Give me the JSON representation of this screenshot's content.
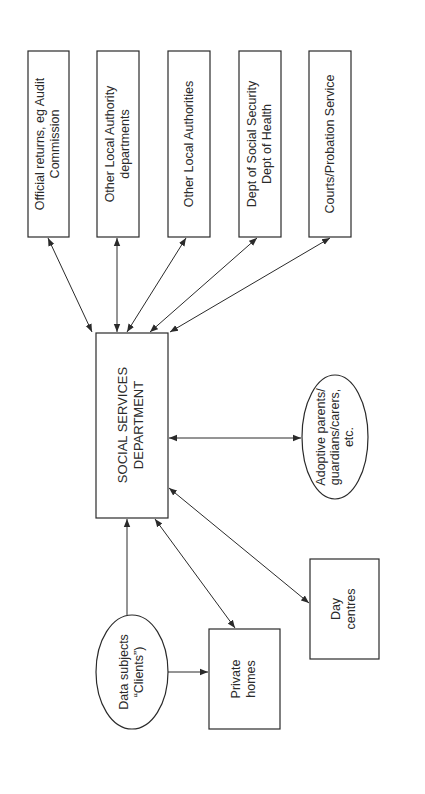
{
  "diagram": {
    "center": {
      "id": "ssd",
      "lines": [
        "SOCIAL SERVICES",
        "DEPARTMENT"
      ],
      "shape": "rectangle"
    },
    "top_boxes": [
      {
        "id": "audit",
        "lines": [
          "Official returns, eg Audit",
          "Commission"
        ]
      },
      {
        "id": "other-dept",
        "lines": [
          "Other Local Authority",
          "departments"
        ]
      },
      {
        "id": "other-la",
        "lines": [
          "Other Local Authorities"
        ]
      },
      {
        "id": "dss",
        "lines": [
          "Dept of Social Security",
          "Dept of Health"
        ]
      },
      {
        "id": "courts",
        "lines": [
          "Courts/Probation Service"
        ]
      }
    ],
    "adoptive": {
      "lines": [
        "Adoptive parents/",
        "guardians/carers,",
        "etc."
      ],
      "shape": "ellipse"
    },
    "clients": {
      "lines": [
        "Data subjects",
        "“Clients”)"
      ],
      "shape": "ellipse"
    },
    "private_homes": {
      "lines": [
        "Private",
        "homes"
      ],
      "shape": "rectangle"
    },
    "day_centres": {
      "lines": [
        "Day",
        "centres"
      ],
      "shape": "rectangle"
    },
    "edges": [
      {
        "from": "ssd",
        "to": "audit",
        "direction": "both"
      },
      {
        "from": "ssd",
        "to": "other-dept",
        "direction": "both"
      },
      {
        "from": "ssd",
        "to": "other-la",
        "direction": "both"
      },
      {
        "from": "ssd",
        "to": "dss",
        "direction": "both"
      },
      {
        "from": "ssd",
        "to": "courts",
        "direction": "both"
      },
      {
        "from": "ssd",
        "to": "adoptive",
        "direction": "both"
      },
      {
        "from": "clients",
        "to": "ssd",
        "direction": "forward"
      },
      {
        "from": "ssd",
        "to": "private_homes",
        "direction": "both"
      },
      {
        "from": "ssd",
        "to": "day_centres",
        "direction": "both"
      },
      {
        "from": "clients",
        "to": "private_homes",
        "direction": "forward"
      }
    ],
    "colors": {
      "stroke": "#2a2a2a",
      "background": "#ffffff"
    }
  }
}
